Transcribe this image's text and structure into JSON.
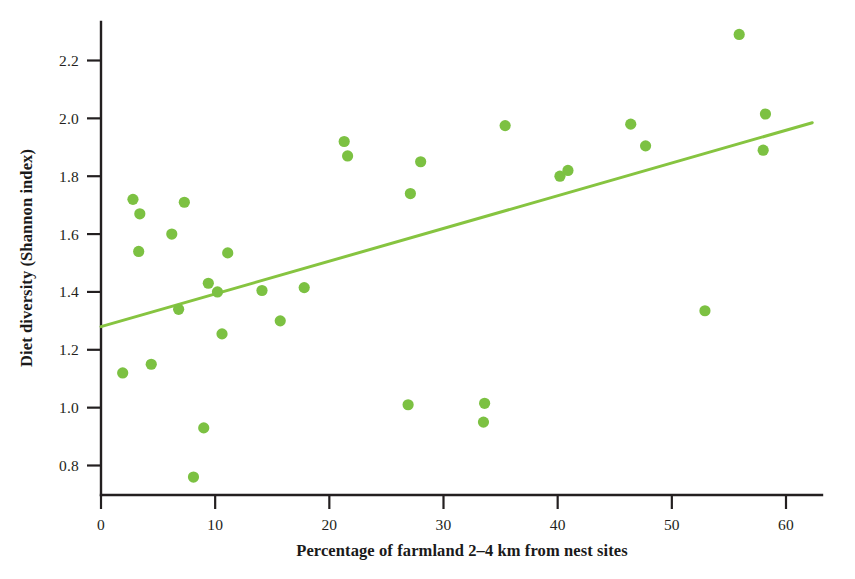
{
  "figure": {
    "background_color": "#ffffff",
    "point_color": "#7cc142",
    "line_color": "#86c440",
    "axis_color": "#231f20"
  },
  "chart_data": {
    "type": "scatter",
    "title": "",
    "xlabel": "Percentage of farmland 2–4 km from nest sites",
    "ylabel": "Diet diversity (Shannon index)",
    "xlim": [
      0,
      62.5
    ],
    "ylim": [
      0.68,
      2.34
    ],
    "grid": false,
    "legend": null,
    "xticks": [
      0,
      10,
      20,
      30,
      40,
      50,
      60
    ],
    "xticklabels": [
      "0",
      "10",
      "20",
      "30",
      "40",
      "50",
      "60"
    ],
    "yticks": [
      0.8,
      1.0,
      1.2,
      1.4,
      1.6,
      1.8,
      2.0,
      2.2
    ],
    "yticklabels": [
      "0.8",
      "1.0",
      "1.2",
      "1.4",
      "1.6",
      "1.8",
      "2.0",
      "2.2"
    ],
    "series": [
      {
        "name": "Nest sites",
        "marker": "circle",
        "color": "#7cc142",
        "points": [
          {
            "x": 1.9,
            "y": 1.12
          },
          {
            "x": 2.8,
            "y": 1.72
          },
          {
            "x": 3.3,
            "y": 1.54
          },
          {
            "x": 3.4,
            "y": 1.67
          },
          {
            "x": 4.4,
            "y": 1.15
          },
          {
            "x": 6.2,
            "y": 1.6
          },
          {
            "x": 7.3,
            "y": 1.71
          },
          {
            "x": 6.8,
            "y": 1.34
          },
          {
            "x": 8.1,
            "y": 0.76
          },
          {
            "x": 9.0,
            "y": 0.93
          },
          {
            "x": 9.4,
            "y": 1.43
          },
          {
            "x": 10.2,
            "y": 1.4
          },
          {
            "x": 10.6,
            "y": 1.255
          },
          {
            "x": 11.1,
            "y": 1.535
          },
          {
            "x": 14.1,
            "y": 1.405
          },
          {
            "x": 15.7,
            "y": 1.3
          },
          {
            "x": 17.8,
            "y": 1.415
          },
          {
            "x": 21.3,
            "y": 1.92
          },
          {
            "x": 21.6,
            "y": 1.87
          },
          {
            "x": 26.9,
            "y": 1.01
          },
          {
            "x": 27.1,
            "y": 1.74
          },
          {
            "x": 28.0,
            "y": 1.85
          },
          {
            "x": 33.5,
            "y": 0.95
          },
          {
            "x": 33.6,
            "y": 1.015
          },
          {
            "x": 35.4,
            "y": 1.975
          },
          {
            "x": 40.2,
            "y": 1.8
          },
          {
            "x": 40.9,
            "y": 1.82
          },
          {
            "x": 46.4,
            "y": 1.98
          },
          {
            "x": 47.7,
            "y": 1.905
          },
          {
            "x": 52.9,
            "y": 1.335
          },
          {
            "x": 55.9,
            "y": 2.29
          },
          {
            "x": 58.2,
            "y": 2.015
          },
          {
            "x": 58.0,
            "y": 1.89
          }
        ]
      }
    ],
    "trendline": {
      "name": "Linear fit",
      "color": "#86c440",
      "x_start": 0,
      "y_start": 1.28,
      "x_end": 62.3,
      "y_end": 1.985
    }
  }
}
